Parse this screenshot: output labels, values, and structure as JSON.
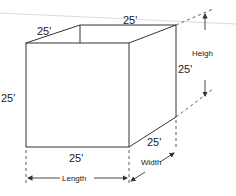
{
  "diagram": {
    "type": "box-dimensions",
    "labels": {
      "top_back": "25'",
      "top_left_depth": "25'",
      "left_height": "25'",
      "right_height": "25'",
      "bottom_front": "25'",
      "bottom_right_depth": "25'",
      "height_dim": "Heigh",
      "width_dim": "Width",
      "length_dim": "Length"
    },
    "colors": {
      "line": "#333333",
      "guide": "#d0d0d0"
    }
  }
}
